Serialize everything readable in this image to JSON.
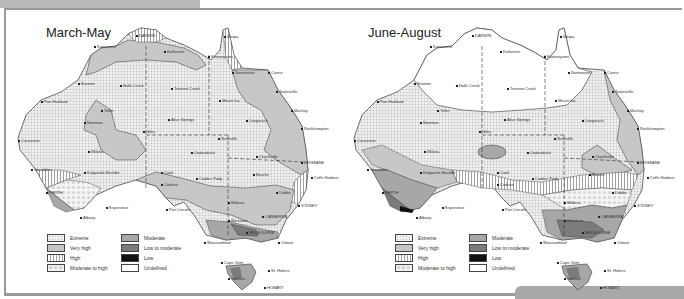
{
  "figure": {
    "colors": {
      "frame": "#9a9a9a",
      "extreme": "#e6e6e6",
      "very_high": "#c7c7c7",
      "high": "#9f9f9f",
      "moderate_to_high": "#d4d4d4",
      "moderate": "#a7a7a7",
      "low_to_moderate": "#7b7b7b",
      "low": "#101010",
      "undefined": "#ffffff"
    }
  },
  "legend": {
    "items": [
      {
        "key": "extreme",
        "label": "Extreme"
      },
      {
        "key": "very_high",
        "label": "Very high"
      },
      {
        "key": "high",
        "label": "High"
      },
      {
        "key": "moderate_to_high",
        "label": "Moderate to high"
      },
      {
        "key": "moderate",
        "label": "Moderate"
      },
      {
        "key": "low_to_moderate",
        "label": "Low to moderate"
      },
      {
        "key": "low",
        "label": "Low"
      },
      {
        "key": "undefined",
        "label": "Undefined"
      }
    ]
  },
  "maps": [
    {
      "title": "March-May",
      "cities": [
        {
          "name": "DARWIN",
          "x": 130,
          "y": 23
        },
        {
          "name": "Kununurra",
          "x": 88,
          "y": 34
        },
        {
          "name": "Katherine",
          "x": 158,
          "y": 39
        },
        {
          "name": "Weipa",
          "x": 218,
          "y": 24
        },
        {
          "name": "Kowanyama",
          "x": 202,
          "y": 44
        },
        {
          "name": "Normanton",
          "x": 226,
          "y": 60
        },
        {
          "name": "Cairns",
          "x": 262,
          "y": 60
        },
        {
          "name": "Broome",
          "x": 72,
          "y": 71
        },
        {
          "name": "Halls Creek",
          "x": 114,
          "y": 73
        },
        {
          "name": "Tennant Creek",
          "x": 165,
          "y": 76
        },
        {
          "name": "Townsville",
          "x": 270,
          "y": 79
        },
        {
          "name": "Port Hedland",
          "x": 35,
          "y": 89
        },
        {
          "name": "Mount Isa",
          "x": 213,
          "y": 88
        },
        {
          "name": "Telfer",
          "x": 95,
          "y": 98
        },
        {
          "name": "Mackay",
          "x": 285,
          "y": 98
        },
        {
          "name": "Newman",
          "x": 78,
          "y": 110
        },
        {
          "name": "Alice Springs",
          "x": 162,
          "y": 107
        },
        {
          "name": "Longreach",
          "x": 240,
          "y": 108
        },
        {
          "name": "Rockhampton",
          "x": 295,
          "y": 116
        },
        {
          "name": "Giles",
          "x": 137,
          "y": 119
        },
        {
          "name": "Birdsville",
          "x": 212,
          "y": 126
        },
        {
          "name": "Carnarvon",
          "x": 12,
          "y": 128
        },
        {
          "name": "Wiluna",
          "x": 82,
          "y": 139
        },
        {
          "name": "Oodnadatta",
          "x": 185,
          "y": 140
        },
        {
          "name": "Charleville",
          "x": 250,
          "y": 144
        },
        {
          "name": "BRISBANE",
          "x": 295,
          "y": 150
        },
        {
          "name": "Geraldton",
          "x": 25,
          "y": 157
        },
        {
          "name": "Kalgoorlie-Boulder",
          "x": 78,
          "y": 160
        },
        {
          "name": "Bourke",
          "x": 247,
          "y": 162
        },
        {
          "name": "Coffs Harbour",
          "x": 305,
          "y": 165
        },
        {
          "name": "Cook",
          "x": 155,
          "y": 160
        },
        {
          "name": "Ceduna",
          "x": 155,
          "y": 172
        },
        {
          "name": "Coober Pedy",
          "x": 190,
          "y": 166
        },
        {
          "name": "Dubbo",
          "x": 270,
          "y": 180
        },
        {
          "name": "PERTH",
          "x": 40,
          "y": 180
        },
        {
          "name": "Esperance",
          "x": 100,
          "y": 195
        },
        {
          "name": "Port Lincoln",
          "x": 160,
          "y": 197
        },
        {
          "name": "Mildura",
          "x": 222,
          "y": 190
        },
        {
          "name": "SYDNEY",
          "x": 292,
          "y": 193
        },
        {
          "name": "Albany",
          "x": 74,
          "y": 205
        },
        {
          "name": "CANBERRA",
          "x": 256,
          "y": 204
        },
        {
          "name": "Horsham",
          "x": 222,
          "y": 208
        },
        {
          "name": "MELBOURNE",
          "x": 240,
          "y": 220
        },
        {
          "name": "Warrnambool",
          "x": 198,
          "y": 230
        },
        {
          "name": "Orbost",
          "x": 272,
          "y": 230
        },
        {
          "name": "Cape Grim",
          "x": 215,
          "y": 250
        },
        {
          "name": "St. Helens",
          "x": 262,
          "y": 258
        },
        {
          "name": "Strahan",
          "x": 222,
          "y": 266
        },
        {
          "name": "HOBART",
          "x": 258,
          "y": 275
        }
      ]
    },
    {
      "title": "June-August",
      "cities": [
        {
          "name": "DARWIN",
          "x": 130,
          "y": 23
        },
        {
          "name": "Kununurra",
          "x": 88,
          "y": 34
        },
        {
          "name": "Katherine",
          "x": 158,
          "y": 39
        },
        {
          "name": "Weipa",
          "x": 218,
          "y": 24
        },
        {
          "name": "Kowanyama",
          "x": 202,
          "y": 44
        },
        {
          "name": "Normanton",
          "x": 226,
          "y": 60
        },
        {
          "name": "Cairns",
          "x": 262,
          "y": 60
        },
        {
          "name": "Broome",
          "x": 72,
          "y": 71
        },
        {
          "name": "Halls Creek",
          "x": 114,
          "y": 73
        },
        {
          "name": "Tennant Creek",
          "x": 165,
          "y": 76
        },
        {
          "name": "Townsville",
          "x": 270,
          "y": 79
        },
        {
          "name": "Port Hedland",
          "x": 35,
          "y": 89
        },
        {
          "name": "Mount Isa",
          "x": 213,
          "y": 88
        },
        {
          "name": "Telfer",
          "x": 95,
          "y": 98
        },
        {
          "name": "Mackay",
          "x": 285,
          "y": 98
        },
        {
          "name": "Newman",
          "x": 78,
          "y": 110
        },
        {
          "name": "Alice Springs",
          "x": 162,
          "y": 107
        },
        {
          "name": "Longreach",
          "x": 240,
          "y": 108
        },
        {
          "name": "Rockhampton",
          "x": 295,
          "y": 116
        },
        {
          "name": "Giles",
          "x": 137,
          "y": 119
        },
        {
          "name": "Birdsville",
          "x": 212,
          "y": 126
        },
        {
          "name": "Carnarvon",
          "x": 12,
          "y": 128
        },
        {
          "name": "Wiluna",
          "x": 82,
          "y": 139
        },
        {
          "name": "Oodnadatta",
          "x": 185,
          "y": 140
        },
        {
          "name": "Charleville",
          "x": 250,
          "y": 144
        },
        {
          "name": "BRISBANE",
          "x": 295,
          "y": 150
        },
        {
          "name": "Geraldton",
          "x": 25,
          "y": 157
        },
        {
          "name": "Kalgoorlie-Boulder",
          "x": 78,
          "y": 160
        },
        {
          "name": "Bourke",
          "x": 247,
          "y": 162
        },
        {
          "name": "Coffs Harbour",
          "x": 305,
          "y": 165
        },
        {
          "name": "Cook",
          "x": 155,
          "y": 160
        },
        {
          "name": "Ceduna",
          "x": 155,
          "y": 172
        },
        {
          "name": "Coober Pedy",
          "x": 190,
          "y": 166
        },
        {
          "name": "Dubbo",
          "x": 270,
          "y": 180
        },
        {
          "name": "PERTH",
          "x": 40,
          "y": 180
        },
        {
          "name": "Esperance",
          "x": 100,
          "y": 195
        },
        {
          "name": "Port Lincoln",
          "x": 160,
          "y": 197
        },
        {
          "name": "Mildura",
          "x": 222,
          "y": 190
        },
        {
          "name": "SYDNEY",
          "x": 292,
          "y": 193
        },
        {
          "name": "Albany",
          "x": 74,
          "y": 205
        },
        {
          "name": "CANBERRA",
          "x": 256,
          "y": 204
        },
        {
          "name": "Horsham",
          "x": 222,
          "y": 208
        },
        {
          "name": "MELBOURNE",
          "x": 240,
          "y": 220
        },
        {
          "name": "Warrnambool",
          "x": 198,
          "y": 230
        },
        {
          "name": "Orbost",
          "x": 272,
          "y": 230
        },
        {
          "name": "Cape Grim",
          "x": 215,
          "y": 250
        },
        {
          "name": "St. Helens",
          "x": 262,
          "y": 258
        },
        {
          "name": "Strahan",
          "x": 222,
          "y": 266
        },
        {
          "name": "HOBART",
          "x": 258,
          "y": 275
        }
      ]
    }
  ]
}
